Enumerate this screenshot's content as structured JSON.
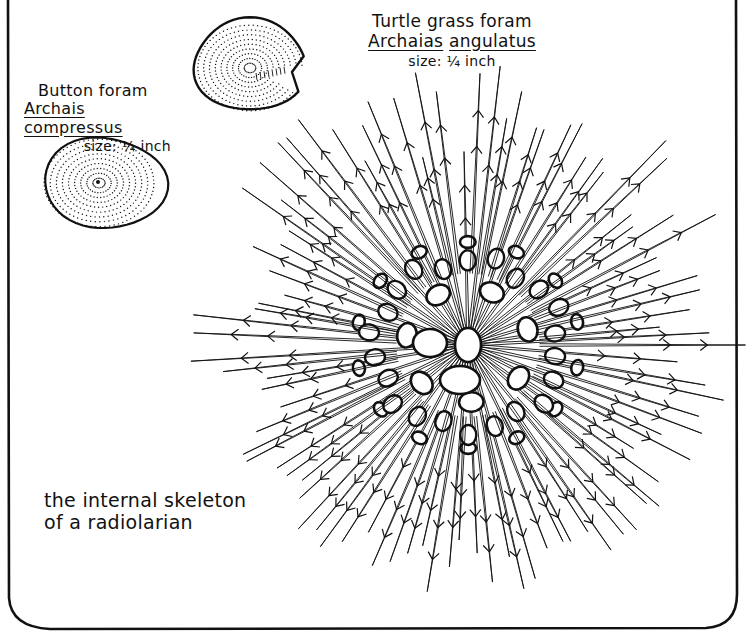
{
  "colors": {
    "ink": "#111111",
    "paper": "#ffffff"
  },
  "turtle_grass_foram": {
    "common_name": "Turtle grass foram",
    "genus": "Archaias",
    "species": "angulatus",
    "size": "size: ¼ inch",
    "shape": {
      "cx": 250,
      "cy": 65,
      "rx": 56,
      "ry": 46,
      "notch_x": 292,
      "notch_y": 72
    }
  },
  "button_foram": {
    "common_name": "Button foram",
    "genus": "Archais",
    "species": "compressus",
    "size": "size: ¼ inch",
    "shape": {
      "cx": 105,
      "cy": 183,
      "rx": 59,
      "ry": 47
    }
  },
  "radiolarian": {
    "caption_line1": "the internal skeleton",
    "caption_line2": "of a radiolarian",
    "center": {
      "x": 468,
      "y": 345
    },
    "sphere_radius": 130,
    "spine_count": 96,
    "spine_min_length": 190,
    "spine_max_length": 285
  },
  "border": {
    "x": 8,
    "y": -4,
    "width": 730,
    "height": 634,
    "corner_radius": 22
  }
}
